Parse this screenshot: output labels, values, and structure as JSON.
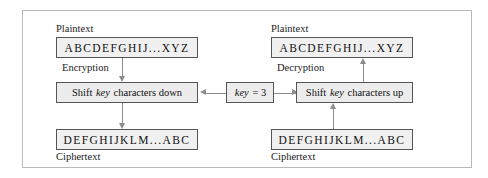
{
  "figure": {
    "frame_color": "#b9b9b9",
    "box_border_color": "#555555",
    "box_fill_color": "#efefef",
    "arrow_color": "#8c8c8c"
  },
  "left_panel": {
    "plaintext_label": "Plaintext",
    "plaintext_value": "ABCDEFGHIJ...XYZ",
    "operation_label": "Encryption",
    "operation_box": {
      "prefix": "Shift ",
      "emphasis": "key",
      "suffix": " characters down"
    },
    "ciphertext_value": "DEFGHIJKLM...ABC",
    "ciphertext_label": "Ciphertext"
  },
  "right_panel": {
    "plaintext_label": "Plaintext",
    "plaintext_value": "ABCDEFGHIJ...XYZ",
    "operation_label": "Decryption",
    "operation_box": {
      "prefix": "Shift ",
      "emphasis": "key",
      "suffix": " characters up"
    },
    "ciphertext_value": "DEFGHIJKLM...ABC",
    "ciphertext_label": "Ciphertext"
  },
  "key": {
    "emphasis": "key",
    "equals": " = 3"
  }
}
